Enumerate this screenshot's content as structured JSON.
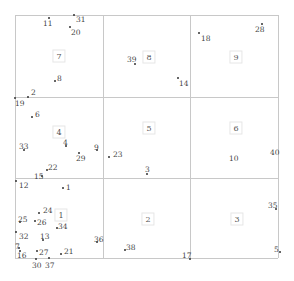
{
  "grid": {
    "x_lines": [
      15,
      103,
      190,
      278
    ],
    "y_lines": [
      15,
      97,
      178,
      258
    ],
    "line_color": "#c8c8c8"
  },
  "cells": [
    {
      "label": "7",
      "x": 59,
      "y": 56
    },
    {
      "label": "8",
      "x": 149,
      "y": 57
    },
    {
      "label": "9",
      "x": 236,
      "y": 57
    },
    {
      "label": "4",
      "x": 59,
      "y": 132
    },
    {
      "label": "5",
      "x": 149,
      "y": 128
    },
    {
      "label": "6",
      "x": 236,
      "y": 128
    },
    {
      "label": "1",
      "x": 61,
      "y": 215
    },
    {
      "label": "2",
      "x": 148,
      "y": 219
    },
    {
      "label": "3",
      "x": 237,
      "y": 219
    }
  ],
  "points": [
    {
      "label": "11",
      "px": 49,
      "py": 18,
      "lx": 43,
      "ly": 20
    },
    {
      "label": "31",
      "px": 74,
      "py": 15,
      "lx": 76,
      "ly": 16
    },
    {
      "label": "20",
      "px": 70,
      "py": 27,
      "lx": 71,
      "ly": 29
    },
    {
      "label": "8",
      "px": 55,
      "py": 81,
      "lx": 57,
      "ly": 75
    },
    {
      "label": "2",
      "px": 28,
      "py": 97,
      "lx": 31,
      "ly": 89
    },
    {
      "label": "19",
      "px": 15,
      "py": 98,
      "lx": 15,
      "ly": 100
    },
    {
      "label": "39",
      "px": 135,
      "py": 64,
      "lx": 127,
      "ly": 56
    },
    {
      "label": "14",
      "px": 178,
      "py": 78,
      "lx": 179,
      "ly": 80
    },
    {
      "label": "18",
      "px": 199,
      "py": 33,
      "lx": 201,
      "ly": 35
    },
    {
      "label": "28",
      "px": 262,
      "py": 24,
      "lx": 255,
      "ly": 26
    },
    {
      "label": "6",
      "px": 32,
      "py": 117,
      "lx": 35,
      "ly": 111
    },
    {
      "label": "33",
      "px": 24,
      "py": 150,
      "lx": 19,
      "ly": 143
    },
    {
      "label": "4",
      "px": 66,
      "py": 146,
      "lx": 63,
      "ly": 139
    },
    {
      "label": "9",
      "px": 97,
      "py": 150,
      "lx": 94,
      "ly": 144
    },
    {
      "label": "29",
      "px": 79,
      "py": 153,
      "lx": 76,
      "ly": 155
    },
    {
      "label": "23",
      "px": 109,
      "py": 157,
      "lx": 113,
      "ly": 151
    },
    {
      "label": "3",
      "px": 147,
      "py": 174,
      "lx": 145,
      "ly": 166
    },
    {
      "label": "10",
      "px": 0,
      "py": 0,
      "lx": 229,
      "ly": 155,
      "no_dot": true
    },
    {
      "label": "40",
      "px": 0,
      "py": 0,
      "lx": 270,
      "ly": 149,
      "no_dot": true
    },
    {
      "label": "22",
      "px": 47,
      "py": 170,
      "lx": 48,
      "ly": 164
    },
    {
      "label": "15",
      "px": 42,
      "py": 176,
      "lx": 34,
      "ly": 173
    },
    {
      "label": "12",
      "px": 16,
      "py": 181,
      "lx": 19,
      "ly": 182
    },
    {
      "label": "1",
      "px": 63,
      "py": 188,
      "lx": 66,
      "ly": 184
    },
    {
      "label": "24",
      "px": 39,
      "py": 213,
      "lx": 43,
      "ly": 207
    },
    {
      "label": "25",
      "px": 20,
      "py": 222,
      "lx": 18,
      "ly": 216
    },
    {
      "label": "26",
      "px": 35,
      "py": 221,
      "lx": 37,
      "ly": 219
    },
    {
      "label": "34",
      "px": 57,
      "py": 228,
      "lx": 58,
      "ly": 223
    },
    {
      "label": "32",
      "px": 16,
      "py": 232,
      "lx": 19,
      "ly": 233
    },
    {
      "label": "13",
      "px": 43,
      "py": 240,
      "lx": 40,
      "ly": 233
    },
    {
      "label": "36",
      "px": 97,
      "py": 242,
      "lx": 94,
      "ly": 236
    },
    {
      "label": "38",
      "px": 125,
      "py": 250,
      "lx": 126,
      "ly": 244
    },
    {
      "label": "7",
      "px": 19,
      "py": 248,
      "lx": 15,
      "ly": 243
    },
    {
      "label": "16",
      "px": 20,
      "py": 251,
      "lx": 17,
      "ly": 252
    },
    {
      "label": "27",
      "px": 37,
      "py": 251,
      "lx": 39,
      "ly": 249
    },
    {
      "label": "21",
      "px": 61,
      "py": 254,
      "lx": 64,
      "ly": 248
    },
    {
      "label": "30",
      "px": 36,
      "py": 259,
      "lx": 32,
      "ly": 262
    },
    {
      "label": "37",
      "px": 49,
      "py": 258,
      "lx": 45,
      "ly": 262
    },
    {
      "label": "17",
      "px": 190,
      "py": 259,
      "lx": 182,
      "ly": 252
    },
    {
      "label": "35",
      "px": 276,
      "py": 209,
      "lx": 268,
      "ly": 202
    },
    {
      "label": "5",
      "px": 280,
      "py": 252,
      "lx": 274,
      "ly": 246
    }
  ]
}
